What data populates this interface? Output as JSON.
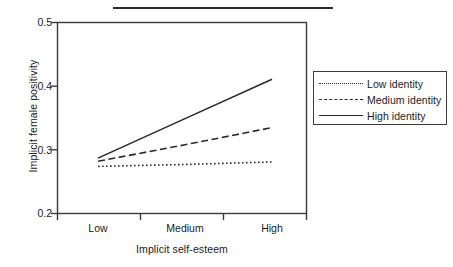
{
  "figure": {
    "top_rule": "horizontal-rule",
    "background": "#ffffff",
    "ink": "#2a2a2a"
  },
  "axis": {
    "y_title": "Implicit female positivity",
    "x_title": "Implicit self-esteem",
    "y_ticks": [
      "0.5",
      "0.4",
      "0.3",
      "0.2"
    ],
    "x_ticks": [
      "Low",
      "Medium",
      "High"
    ]
  },
  "legend": {
    "items": [
      {
        "label": "Low identity",
        "style": "dotted"
      },
      {
        "label": "Medium identity",
        "style": "dashed"
      },
      {
        "label": "High identity",
        "style": "solid"
      }
    ]
  },
  "chart_data": {
    "type": "line",
    "title": "",
    "xlabel": "Implicit self-esteem",
    "ylabel": "Implicit female positivity",
    "categories": [
      "Low",
      "Medium",
      "High"
    ],
    "x": [
      0,
      1,
      2
    ],
    "ylim": [
      0.2,
      0.5
    ],
    "yticks": [
      0.2,
      0.3,
      0.4,
      0.5
    ],
    "grid": false,
    "legend_position": "right-outside",
    "series": [
      {
        "name": "Low identity",
        "style": "dotted",
        "color": "#2a2a2a",
        "values": [
          0.274,
          0.277,
          0.281
        ]
      },
      {
        "name": "Medium identity",
        "style": "dashed",
        "color": "#2a2a2a",
        "values": [
          0.282,
          0.308,
          0.335
        ]
      },
      {
        "name": "High identity",
        "style": "solid",
        "color": "#2a2a2a",
        "values": [
          0.287,
          0.349,
          0.411
        ]
      }
    ]
  }
}
